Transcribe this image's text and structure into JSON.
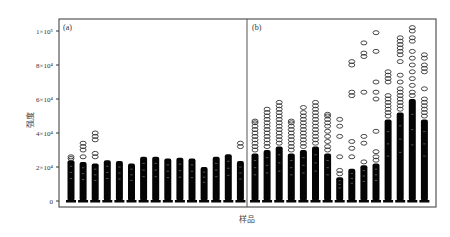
{
  "chart_data": {
    "type": "box",
    "title": "",
    "xlabel": "样品",
    "ylabel": "强度",
    "ylim": [
      0,
      100000
    ],
    "yticks": [
      {
        "value": 0,
        "label": "0"
      },
      {
        "value": 20000,
        "label": "2×10⁴"
      },
      {
        "value": 40000,
        "label": "4×10⁴"
      },
      {
        "value": 60000,
        "label": "6×10⁴"
      },
      {
        "value": 80000,
        "label": "8×10⁴"
      },
      {
        "value": 100000,
        "label": "1×10⁵"
      }
    ],
    "grid": false,
    "legend": null,
    "panels": [
      {
        "label": "(a)",
        "samples": [
          {
            "max": 24000,
            "outliers": [
              25000,
              26000
            ]
          },
          {
            "max": 23000,
            "outliers": [
              26000,
              30000,
              32000,
              34000
            ]
          },
          {
            "max": 22000,
            "outliers": [
              26000,
              28000,
              36000,
              38000,
              40000
            ]
          },
          {
            "max": 24000,
            "outliers": []
          },
          {
            "max": 23500,
            "outliers": []
          },
          {
            "max": 22000,
            "outliers": []
          },
          {
            "max": 26000,
            "outliers": []
          },
          {
            "max": 26000,
            "outliers": []
          },
          {
            "max": 25000,
            "outliers": []
          },
          {
            "max": 25500,
            "outliers": []
          },
          {
            "max": 25000,
            "outliers": []
          },
          {
            "max": 20000,
            "outliers": []
          },
          {
            "max": 26000,
            "outliers": []
          },
          {
            "max": 27500,
            "outliers": []
          },
          {
            "max": 23500,
            "outliers": [
              32000,
              34000
            ]
          }
        ]
      },
      {
        "label": "(b)",
        "samples": [
          {
            "max": 28000,
            "outliers": [
              30000,
              32000,
              34000,
              36000,
              38000,
              40000,
              42000,
              44000,
              46000,
              47000
            ]
          },
          {
            "max": 30000,
            "outliers": [
              32000,
              34000,
              36000,
              38000,
              40000,
              42000,
              44000,
              46000,
              48000,
              50000,
              52000,
              54000
            ]
          },
          {
            "max": 32000,
            "outliers": [
              34000,
              36000,
              38000,
              40000,
              42000,
              44000,
              46000,
              48000,
              50000,
              52000,
              54000,
              56000,
              58000
            ]
          },
          {
            "max": 28000,
            "outliers": [
              30000,
              32000,
              34000,
              36000,
              38000,
              40000,
              42000,
              44000,
              46000,
              47000
            ]
          },
          {
            "max": 30000,
            "outliers": [
              32000,
              34000,
              36000,
              38000,
              40000,
              42000,
              44000,
              46000,
              48000,
              50000,
              52000,
              55000
            ]
          },
          {
            "max": 32000,
            "outliers": [
              34000,
              36000,
              38000,
              40000,
              42000,
              44000,
              46000,
              48000,
              50000,
              52000,
              54000,
              56000,
              58000
            ]
          },
          {
            "max": 28000,
            "outliers": [
              30000,
              32000,
              35000,
              38000,
              41000,
              44000,
              46000,
              48000,
              50000,
              51000
            ]
          },
          {
            "max": 14000,
            "outliers": [
              16000,
              18000,
              26000,
              38000,
              44000,
              48000
            ]
          },
          {
            "max": 19000,
            "outliers": [
              26000,
              31000,
              35000,
              62000,
              64000,
              80000,
              82000
            ]
          },
          {
            "max": 21000,
            "outliers": [
              23000,
              34000,
              38000,
              64000,
              85000,
              87000,
              93000
            ]
          },
          {
            "max": 22000,
            "outliers": [
              24000,
              26000,
              29000,
              41000,
              60000,
              64000,
              70000,
              88000,
              99000
            ]
          },
          {
            "max": 48000,
            "outliers": [
              50000,
              52000,
              54000,
              56000,
              58000,
              60000,
              62000,
              70000,
              72000,
              74000,
              76000
            ]
          },
          {
            "max": 52000,
            "outliers": [
              54000,
              56000,
              58000,
              60000,
              62000,
              64000,
              66000,
              70000,
              74000,
              82000,
              86000,
              88000,
              90000,
              92000,
              94000,
              96000
            ]
          },
          {
            "max": 60000,
            "outliers": [
              62000,
              64000,
              68000,
              72000,
              76000,
              80000,
              84000,
              88000,
              94000,
              96000,
              100000,
              102000
            ]
          },
          {
            "max": 48000,
            "outliers": [
              50000,
              52000,
              54000,
              56000,
              58000,
              60000,
              66000,
              76000,
              78000,
              80000,
              84000,
              86000
            ]
          }
        ]
      }
    ]
  }
}
